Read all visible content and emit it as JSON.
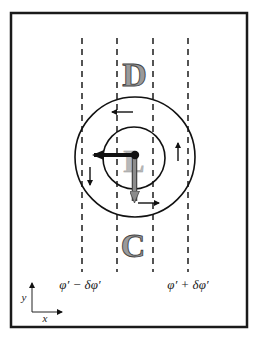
{
  "diagram": {
    "frame": {
      "x": 11,
      "y": 13,
      "width": 236,
      "height": 314,
      "stroke": "#1a1a1a",
      "stroke_width": 2.5
    },
    "dashed_lines": [
      {
        "id": "line-1",
        "x": 82
      },
      {
        "id": "line-2",
        "x": 117
      },
      {
        "id": "line-3",
        "x": 153
      },
      {
        "id": "line-4",
        "x": 188
      }
    ],
    "dashed_line_range": {
      "y1": 38,
      "y2": 272
    },
    "circles": {
      "outer": {
        "cx": 135,
        "cy": 157,
        "r": 60
      },
      "inner": {
        "cx": 134,
        "cy": 158,
        "r": 31
      }
    },
    "letters": {
      "top": "D",
      "center": "L",
      "bottom": "C"
    },
    "labels": {
      "left_phi": "φ′ − δφ′",
      "right_phi": "φ′ + δφ′",
      "axis_x": "x",
      "axis_y": "y"
    },
    "colors": {
      "line": "#2a2a2a",
      "letter_fill": "#9a9a9a",
      "letter_stroke": "#444444",
      "center_letter_fill": "#b0b0b0",
      "gray_arrow": "#8c8c8c",
      "black": "#111111"
    }
  }
}
